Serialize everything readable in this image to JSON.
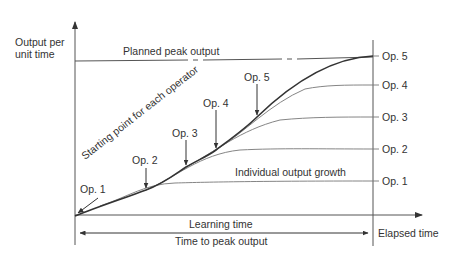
{
  "diagram": {
    "y_axis_label_line1": "Output per",
    "y_axis_label_line2": "unit time",
    "x_axis_label": "Elapsed time",
    "planned_peak_label": "Planned peak output",
    "starting_point_label": "Starting point for each operator",
    "individual_growth_label": "Individual output growth",
    "learning_time_label": "Learning time",
    "time_to_peak_label": "Time to peak output",
    "start_arrows": [
      {
        "label": "Op. 1"
      },
      {
        "label": "Op. 2"
      },
      {
        "label": "Op. 3"
      },
      {
        "label": "Op. 4"
      },
      {
        "label": "Op. 5"
      }
    ],
    "right_labels": [
      {
        "label": "Op. 5"
      },
      {
        "label": "Op. 4"
      },
      {
        "label": "Op. 3"
      },
      {
        "label": "Op. 2"
      },
      {
        "label": "Op. 1"
      }
    ],
    "colors": {
      "line": "#333333",
      "thin_line": "#777777",
      "text": "#333333",
      "background": "#ffffff"
    }
  }
}
